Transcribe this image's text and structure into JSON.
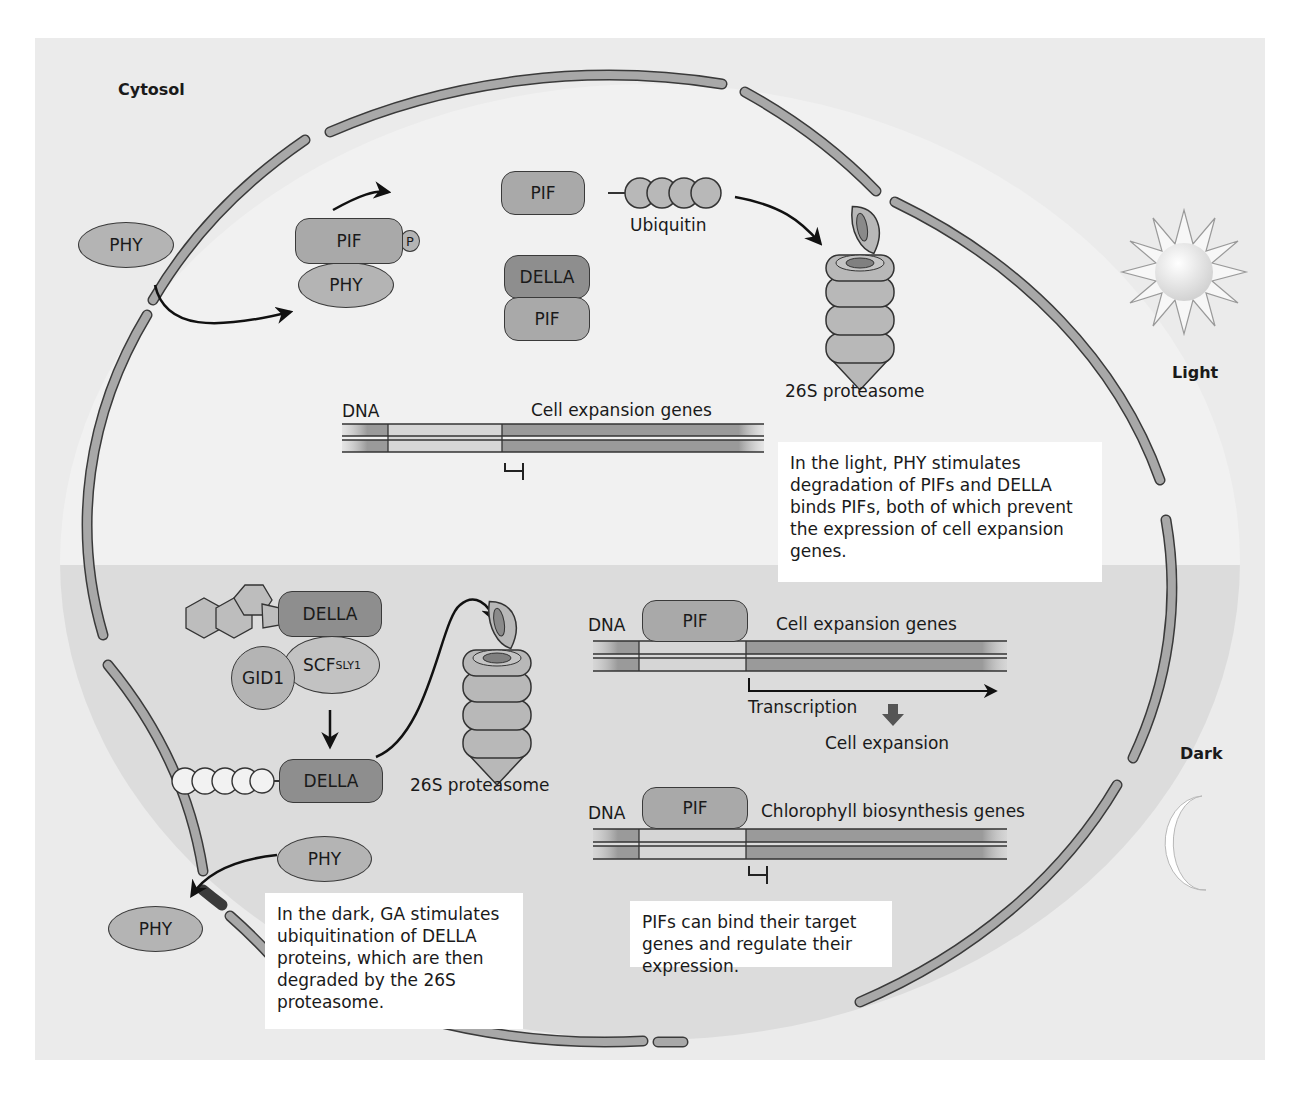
{
  "figure": {
    "region_labels": {
      "cytosol": "Cytosol",
      "light": "Light",
      "dark": "Dark"
    },
    "colors": {
      "panel_bg": "#ebebeb",
      "dark_region_bg": "#dcdcdc",
      "membrane": "#a8a8a8",
      "pif": "#a9a9a9",
      "della": "#8e8e8e",
      "phy": "#b4b4b4"
    },
    "light_section": {
      "phy_outside": "PHY",
      "complex": {
        "pif": "PIF",
        "phosphate": "P",
        "phy": "PHY"
      },
      "ubiquitinated": {
        "pif": "PIF",
        "ubiquitin_label": "Ubiquitin"
      },
      "della_pif": {
        "della": "DELLA",
        "pif": "PIF"
      },
      "proteasome_label": "26S proteasome",
      "dna": {
        "dna_label": "DNA",
        "gene_label": "Cell expansion genes"
      },
      "note": "In the light, PHY stimulates degradation of PIFs and DELLA binds PIFs, both of which prevent the expression of cell expansion genes."
    },
    "dark_section": {
      "ga_complex": {
        "della": "DELLA",
        "gid1": "GID1",
        "scf": "SCF",
        "scf_sup": "SLY1"
      },
      "ubiquitinated_della": "DELLA",
      "proteasome_label": "26S proteasome",
      "phy_inside": "PHY",
      "phy_outside": "PHY",
      "dna1": {
        "dna_label": "DNA",
        "pif": "PIF",
        "gene_label": "Cell expansion genes",
        "transcription": "Transcription",
        "outcome": "Cell expansion"
      },
      "dna2": {
        "dna_label": "DNA",
        "pif": "PIF",
        "gene_label": "Chlorophyll biosynthesis genes"
      },
      "note_left": "In the dark, GA stimulates ubiquitination of DELLA proteins, which are then degraded by the 26S proteasome.",
      "note_right": "PIFs can bind their target genes and regulate their expression."
    }
  }
}
